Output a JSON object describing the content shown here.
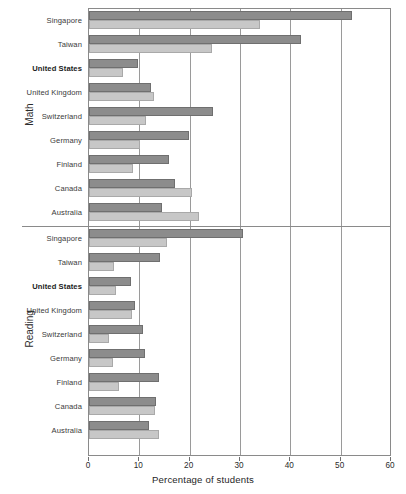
{
  "chart_data": {
    "type": "bar",
    "orientation": "horizontal",
    "title": "",
    "xlabel": "Percentage of students",
    "ylabel": "",
    "xlim": [
      0,
      60
    ],
    "xticks": [
      0,
      10,
      20,
      30,
      40,
      50,
      60
    ],
    "xtick_labels": [
      "0",
      "10",
      "20",
      "30",
      "40",
      "50",
      "60"
    ],
    "grid": "vertical",
    "legend_position": "none",
    "legend": [
      "Series 1 (dark)",
      "Series 2 (light)"
    ],
    "series": [
      {
        "name": "dark",
        "color": "#8c8c8c"
      },
      {
        "name": "light",
        "color": "#c7c7c7"
      }
    ],
    "panels": [
      {
        "label": "Math",
        "categories": [
          "Singapore",
          "Taiwan",
          "United States",
          "United Kingdom",
          "Switzerland",
          "Germany",
          "Finland",
          "Canada",
          "Australia"
        ],
        "highlight": "United States",
        "values_dark": [
          52.2,
          42.1,
          9.8,
          12.3,
          24.7,
          19.8,
          15.9,
          17.1,
          14.6
        ],
        "values_light": [
          34.0,
          24.5,
          6.8,
          12.9,
          11.4,
          10.1,
          8.8,
          20.5,
          21.9
        ]
      },
      {
        "label": "Reading",
        "categories": [
          "Singapore",
          "Taiwan",
          "United States",
          "United Kingdom",
          "Switzerland",
          "Germany",
          "Finland",
          "Canada",
          "Australia"
        ],
        "highlight": "United States",
        "values_dark": [
          30.6,
          14.2,
          8.3,
          9.1,
          10.8,
          11.1,
          13.9,
          13.3,
          12.0
        ],
        "values_light": [
          15.5,
          4.9,
          5.4,
          8.5,
          3.9,
          4.7,
          6.0,
          13.1,
          13.9
        ]
      }
    ]
  },
  "axis": {
    "x_title": "Percentage of students"
  },
  "colors": {
    "bar_dark": "#8c8c8c",
    "bar_dark_edge": "#6f6f6f",
    "bar_light": "#c7c7c7",
    "bar_light_edge": "#a9a9a9",
    "grid": "#9a9a9a",
    "frame": "#8a8a8a",
    "text": "#2b2b2b"
  }
}
